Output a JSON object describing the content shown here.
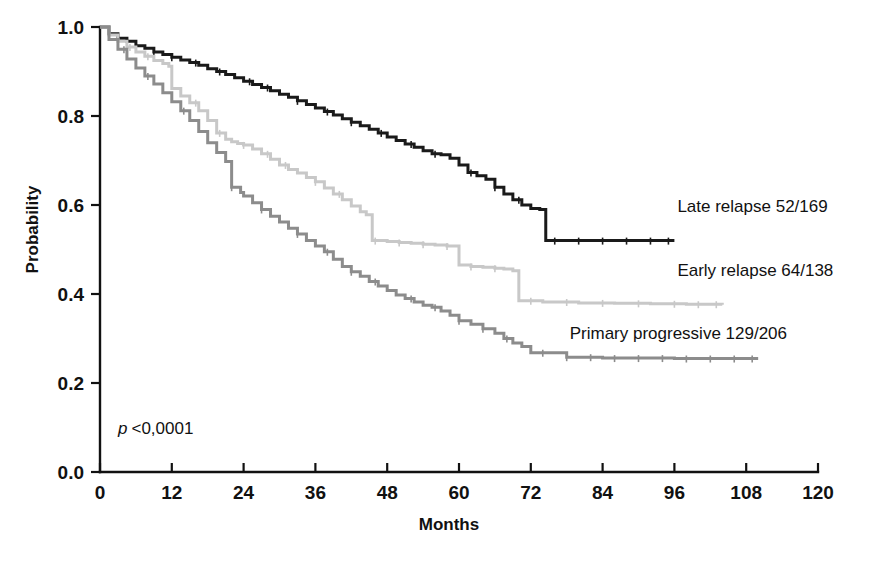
{
  "chart_data": {
    "type": "line",
    "title": "",
    "xlabel": "Months",
    "ylabel": "Probability",
    "xlim": [
      0,
      120
    ],
    "ylim": [
      0.0,
      1.0
    ],
    "xticks": [
      "0",
      "12",
      "24",
      "36",
      "48",
      "60",
      "72",
      "84",
      "96",
      "108",
      "120"
    ],
    "xtick_values": [
      0,
      12,
      24,
      36,
      48,
      60,
      72,
      84,
      96,
      108,
      120
    ],
    "yticks": [
      "0.0",
      "0.2",
      "0.4",
      "0.6",
      "0.8",
      "1.0"
    ],
    "ytick_values": [
      0.0,
      0.2,
      0.4,
      0.6,
      0.8,
      1.0
    ],
    "grid": false,
    "legend_position": "inline-right-of-curve-ends",
    "annotation": "p < 0,0001",
    "annotation_p": "p",
    "annotation_rest": "<0,0001",
    "series": [
      {
        "name": "Late relapse 52/169",
        "label": "Late relapse 52/169",
        "color": "#1a1a1a",
        "stroke_width": 3.0,
        "label_x": 96.5,
        "label_y": 0.585,
        "x": [
          0,
          1.5,
          3,
          4.5,
          6,
          7.5,
          9,
          10.5,
          12,
          13.5,
          15,
          16.5,
          18,
          19.5,
          21,
          22.5,
          24,
          25.5,
          27,
          28.5,
          30,
          31.5,
          33,
          34.5,
          36,
          37.5,
          39,
          40.5,
          42,
          43.5,
          45,
          46.5,
          48,
          49.5,
          51,
          52.5,
          54,
          55.5,
          57,
          58.5,
          60,
          61.5,
          63,
          64.5,
          66,
          67.5,
          69,
          70.5,
          72,
          73.5,
          74.5,
          80,
          86,
          92,
          96
        ],
        "y": [
          1.0,
          0.985,
          0.975,
          0.968,
          0.958,
          0.952,
          0.944,
          0.938,
          0.932,
          0.926,
          0.92,
          0.914,
          0.906,
          0.9,
          0.893,
          0.886,
          0.878,
          0.871,
          0.864,
          0.857,
          0.849,
          0.842,
          0.834,
          0.826,
          0.818,
          0.81,
          0.802,
          0.794,
          0.786,
          0.778,
          0.77,
          0.762,
          0.753,
          0.745,
          0.737,
          0.73,
          0.722,
          0.715,
          0.713,
          0.705,
          0.69,
          0.673,
          0.666,
          0.658,
          0.64,
          0.625,
          0.612,
          0.6,
          0.592,
          0.59,
          0.52,
          0.52,
          0.52,
          0.52,
          0.52
        ],
        "censor_x": [
          6,
          9,
          12,
          16,
          20,
          25,
          28,
          33,
          38,
          42,
          47,
          52,
          56,
          62,
          66,
          70,
          76,
          80,
          84,
          88,
          92,
          95
        ],
        "final_value": 0.52,
        "end_month": 96
      },
      {
        "name": "Early relapse 64/138",
        "label": "Early relapse 64/138",
        "color": "#c8c8c8",
        "stroke_width": 3.0,
        "label_x": 96.5,
        "label_y": 0.44,
        "x": [
          0,
          1.5,
          3,
          4.5,
          6,
          7.5,
          9,
          10.5,
          11.5,
          12,
          13.5,
          15,
          16.5,
          18,
          19.5,
          21,
          22,
          23,
          24,
          25.5,
          27,
          28.5,
          30,
          31.5,
          33,
          34.5,
          36,
          37.5,
          39,
          40.5,
          42,
          43.5,
          44.5,
          45.5,
          48,
          50,
          52,
          54,
          56,
          58,
          60,
          62,
          64,
          66,
          67.5,
          69,
          70,
          74,
          80,
          86,
          92,
          98,
          104
        ],
        "y": [
          1.0,
          0.982,
          0.968,
          0.955,
          0.944,
          0.934,
          0.925,
          0.918,
          0.912,
          0.862,
          0.845,
          0.83,
          0.812,
          0.79,
          0.762,
          0.748,
          0.742,
          0.738,
          0.735,
          0.726,
          0.715,
          0.703,
          0.69,
          0.68,
          0.672,
          0.662,
          0.652,
          0.638,
          0.625,
          0.612,
          0.598,
          0.585,
          0.578,
          0.52,
          0.518,
          0.516,
          0.514,
          0.512,
          0.51,
          0.508,
          0.465,
          0.462,
          0.46,
          0.458,
          0.456,
          0.452,
          0.385,
          0.382,
          0.38,
          0.379,
          0.378,
          0.377,
          0.376
        ],
        "censor_x": [
          5,
          8,
          16,
          20,
          24,
          28,
          31,
          36,
          40,
          46,
          50,
          54,
          58,
          62,
          66,
          72,
          78,
          84,
          90,
          96,
          100,
          103
        ],
        "final_value": 0.376,
        "end_month": 104
      },
      {
        "name": "Primary progressive 129/206",
        "label": "Primary progressive 129/206",
        "color": "#8c8c8c",
        "stroke_width": 3.0,
        "label_x": 78.5,
        "label_y": 0.3,
        "x": [
          0,
          1.5,
          3,
          4.5,
          6,
          7.5,
          9,
          10.5,
          12,
          13.5,
          15,
          16.5,
          18,
          19.5,
          21,
          22,
          23.5,
          24,
          25.5,
          27,
          28.5,
          30,
          31.5,
          33,
          34.5,
          36,
          37.5,
          39,
          40.5,
          42,
          43.5,
          45,
          46.5,
          48,
          49.5,
          51,
          52.5,
          54,
          55.5,
          57,
          58.5,
          60,
          62,
          64,
          66,
          67.5,
          69,
          70.5,
          72,
          78,
          84,
          90,
          96,
          102,
          108,
          110
        ],
        "y": [
          1.0,
          0.972,
          0.95,
          0.928,
          0.908,
          0.89,
          0.872,
          0.852,
          0.832,
          0.812,
          0.79,
          0.765,
          0.74,
          0.718,
          0.698,
          0.64,
          0.628,
          0.62,
          0.605,
          0.59,
          0.575,
          0.562,
          0.548,
          0.535,
          0.52,
          0.508,
          0.495,
          0.478,
          0.462,
          0.45,
          0.44,
          0.428,
          0.418,
          0.408,
          0.398,
          0.39,
          0.382,
          0.375,
          0.37,
          0.362,
          0.352,
          0.34,
          0.332,
          0.322,
          0.312,
          0.3,
          0.29,
          0.282,
          0.268,
          0.258,
          0.256,
          0.256,
          0.255,
          0.255,
          0.255,
          0.255
        ],
        "censor_x": [
          4,
          8,
          14,
          22,
          27,
          33,
          38,
          42,
          46,
          52,
          56,
          60,
          64,
          68,
          74,
          78,
          82,
          86,
          90,
          94,
          98,
          102,
          106,
          109
        ],
        "final_value": 0.255,
        "end_month": 110
      }
    ]
  },
  "plot_geometry": {
    "left": 100,
    "right": 818,
    "top": 27,
    "bottom": 472
  }
}
